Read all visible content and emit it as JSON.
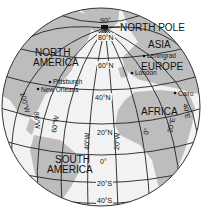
{
  "figure": {
    "type": "orthographic-globe",
    "colors": {
      "ocean": "#f2f2f2",
      "land": "#bdbdbd",
      "grid": "#222222",
      "text": "#111111",
      "background": "#ffffff"
    }
  },
  "regions": {
    "north_pole": "NORTH POLE",
    "north_america_1": "NORTH",
    "north_america_2": "AMERICA",
    "south_america_1": "SOUTH",
    "south_america_2": "AMERICA",
    "asia": "ASIA",
    "europe": "EUROPE",
    "africa": "AFRICA"
  },
  "cities": {
    "leningrad": "Leningrad",
    "london": "London",
    "pittsburgh": "Pittsburgh",
    "new_orleans": "New Orleans",
    "cairo": "Cairo"
  },
  "latitudes": {
    "lat90": "90°",
    "lat80n": "80°N",
    "lat60n": "60°N",
    "lat40n": "40°N",
    "lat20n": "20°N",
    "lat0": "0°",
    "lat20s": "20°S",
    "lat40s": "40°S"
  },
  "longitudes": {
    "lon100w": "100°W",
    "lon80w": "80°W",
    "lon60w": "60°W",
    "lon40w": "40°W",
    "lon20w": "20°W",
    "lon0": "0°",
    "lon20e": "20°E",
    "lon40e": "40°E"
  }
}
